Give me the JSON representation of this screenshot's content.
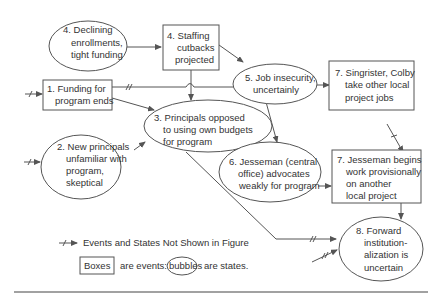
{
  "nodes": {
    "n4a": {
      "type": "state",
      "lines": [
        "4. Declining",
        "enrollments,",
        "tight funding"
      ]
    },
    "n4b": {
      "type": "event",
      "lines": [
        "4. Staffing",
        "cutbacks",
        "projected"
      ]
    },
    "n1": {
      "type": "event",
      "lines": [
        "1. Funding for",
        "program ends"
      ]
    },
    "n5": {
      "type": "state",
      "lines": [
        "5. Job insecurity,",
        "uncertainly"
      ]
    },
    "n7a": {
      "type": "event",
      "lines": [
        "7. Singrister, Colby",
        "take other local",
        "project jobs"
      ]
    },
    "n3": {
      "type": "state",
      "lines": [
        "3. Principals opposed",
        "to using own budgets",
        "for program"
      ]
    },
    "n2": {
      "type": "state",
      "lines": [
        "2. New principals",
        "unfamiliar with",
        "program,",
        "skeptical"
      ]
    },
    "n6": {
      "type": "state",
      "lines": [
        "6. Jesseman (central",
        "office) advocates",
        "weakly for program"
      ]
    },
    "n7b": {
      "type": "event",
      "lines": [
        "7. Jesseman begins",
        "work provisionally",
        "on another",
        "local project"
      ]
    },
    "n8": {
      "type": "state",
      "lines": [
        "8. Forward",
        "institution-",
        "alization is",
        "uncertain"
      ]
    }
  },
  "legend": {
    "arrow_text": "Events and States Not Shown in Figure",
    "boxes_word": "Boxes",
    "events_text": "are events:",
    "bubbles_word": "bubbles",
    "states_text": "are states."
  },
  "colors": {
    "stroke": "#555555",
    "text": "#333333",
    "background": "#ffffff"
  }
}
